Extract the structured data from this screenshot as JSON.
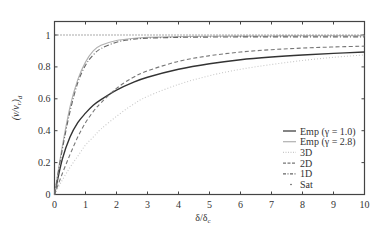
{
  "chart_data": {
    "type": "line",
    "title": "",
    "xlabel": "δ/δ_c",
    "ylabel": "(ν/ν_r)_d",
    "xlim": [
      0,
      10
    ],
    "ylim": [
      0,
      1.08
    ],
    "xticks": [
      0,
      1,
      2,
      3,
      4,
      5,
      6,
      7,
      8,
      9,
      10
    ],
    "yticks": [
      0,
      0.2,
      0.4,
      0.6,
      0.8,
      1
    ],
    "ytick_labels": [
      "0",
      "0.2",
      "0.4",
      "0.6",
      "0.8",
      "1"
    ],
    "grid": false,
    "legend_position": "lower right",
    "x": [
      0,
      0.25,
      0.5,
      0.75,
      1,
      1.25,
      1.5,
      2,
      2.5,
      3,
      4,
      5,
      6,
      7,
      8,
      9,
      10
    ],
    "series": [
      {
        "name": "Emp (γ = 1.0)",
        "style": "solid",
        "color": "#333333",
        "values": [
          0,
          0.22,
          0.36,
          0.45,
          0.51,
          0.56,
          0.595,
          0.655,
          0.7,
          0.735,
          0.785,
          0.82,
          0.845,
          0.862,
          0.875,
          0.885,
          0.893
        ]
      },
      {
        "name": "Emp (γ = 2.8)",
        "style": "solid",
        "color": "#b0b0b0",
        "values": [
          0,
          0.3,
          0.55,
          0.72,
          0.83,
          0.9,
          0.935,
          0.965,
          0.978,
          0.985,
          0.99,
          0.992,
          0.993,
          0.994,
          0.995,
          0.995,
          0.995
        ]
      },
      {
        "name": "3D",
        "style": "dotted",
        "color": "#c8c8c8",
        "values": [
          0,
          0.09,
          0.17,
          0.24,
          0.31,
          0.36,
          0.41,
          0.49,
          0.56,
          0.615,
          0.69,
          0.745,
          0.785,
          0.815,
          0.84,
          0.86,
          0.875
        ]
      },
      {
        "name": "2D",
        "style": "dashed",
        "color": "#777777",
        "values": [
          0,
          0.13,
          0.25,
          0.36,
          0.45,
          0.52,
          0.575,
          0.665,
          0.73,
          0.775,
          0.835,
          0.87,
          0.893,
          0.908,
          0.918,
          0.925,
          0.93
        ]
      },
      {
        "name": "1D",
        "style": "dashdot",
        "color": "#666666",
        "values": [
          0,
          0.28,
          0.52,
          0.7,
          0.81,
          0.875,
          0.915,
          0.955,
          0.972,
          0.98,
          0.985,
          0.987,
          0.988,
          0.988,
          0.988,
          0.988,
          0.988
        ]
      },
      {
        "name": "Sat",
        "style": "dotted",
        "color": "#555555",
        "values": [
          1,
          1,
          1,
          1,
          1,
          1,
          1,
          1,
          1,
          1,
          1,
          1,
          1,
          1,
          1,
          1,
          1
        ]
      }
    ]
  },
  "axes": {
    "xlabel_main": "δ/δ",
    "xlabel_sub": "c",
    "ylabel_main": "(ν/ν",
    "ylabel_sub_r": "r",
    "ylabel_close": ")",
    "ylabel_sub_d": "d"
  },
  "legend": {
    "items": [
      "Emp (γ = 1.0)",
      "Emp (γ = 2.8)",
      "3D",
      "2D",
      "1D",
      "Sat"
    ]
  }
}
